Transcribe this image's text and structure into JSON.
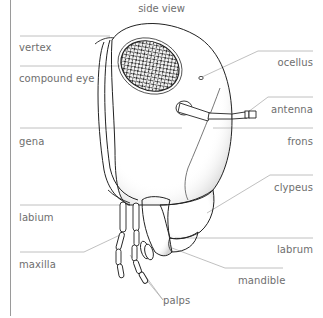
{
  "title": "side view",
  "labels": {
    "vertex": "vertex",
    "compound_eye": "compound eye",
    "gena": "gena",
    "labium": "labium",
    "maxilla": "maxilla",
    "ocellus": "ocellus",
    "antenna": "antenna",
    "frons": "frons",
    "clypeus": "clypeus",
    "labrum": "labrum",
    "mandible": "mandible",
    "palps": "palps"
  },
  "colors": {
    "label_text": "#6e6e6e",
    "leader_line": "#b0b0b0",
    "outline": "#222222",
    "border": "#9a9a9a"
  }
}
